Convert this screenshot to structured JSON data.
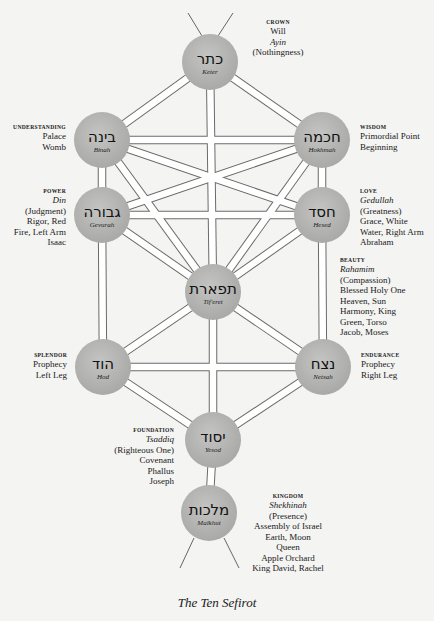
{
  "caption": "The Ten Sefirot",
  "colors": {
    "background": "#f4f4f2",
    "sefirah_fill": "#b6b6b4",
    "channel_stroke": "#6a6a6a",
    "channel_fill": "#ffffff"
  },
  "sefirot": [
    {
      "id": "keter",
      "hebrew": "כתר",
      "name": "Keter",
      "cx": 210,
      "cy": 62,
      "label": {
        "category": "CROWN",
        "lines": [
          "Will"
        ],
        "italic": "Ayin",
        "after": [
          "(Nothingness)"
        ]
      }
    },
    {
      "id": "hokhmah",
      "hebrew": "חכמה",
      "name": "Hokhmah",
      "cx": 322,
      "cy": 140,
      "label": {
        "category": "WISDOM",
        "lines": [
          "Primordial Point",
          "Beginning"
        ]
      }
    },
    {
      "id": "binah",
      "hebrew": "בינה",
      "name": "Binah",
      "cx": 102,
      "cy": 140,
      "label": {
        "category": "UNDERSTANDING",
        "lines": [
          "Palace",
          "Womb"
        ]
      }
    },
    {
      "id": "hesed",
      "hebrew": "חסד",
      "name": "Hesed",
      "cx": 322,
      "cy": 215,
      "label": {
        "category": "LOVE",
        "italic": "Gedullah",
        "after": [
          "(Greatness)",
          "Grace, White",
          "Water, Right Arm",
          "Abraham"
        ]
      }
    },
    {
      "id": "gevurah",
      "hebrew": "גבורה",
      "name": "Gevurah",
      "cx": 102,
      "cy": 215,
      "label": {
        "category": "POWER",
        "italic": "Din",
        "after": [
          "(Judgment)",
          "Rigor, Red",
          "Fire, Left Arm",
          "Isaac"
        ]
      }
    },
    {
      "id": "tiferet",
      "hebrew": "תפארת",
      "name": "Tif'eret",
      "cx": 213,
      "cy": 292,
      "label": {
        "category": "BEAUTY",
        "italic": "Rahamim",
        "after": [
          "(Compassion)",
          "Blessed Holy One",
          "Heaven, Sun",
          "Harmony, King",
          "Green, Torso",
          "Jacob, Moses"
        ]
      }
    },
    {
      "id": "netsah",
      "hebrew": "נצח",
      "name": "Netsah",
      "cx": 323,
      "cy": 367,
      "label": {
        "category": "ENDURANCE",
        "lines": [
          "Prophecy",
          "Right Leg"
        ]
      }
    },
    {
      "id": "hod",
      "hebrew": "הוד",
      "name": "Hod",
      "cx": 103,
      "cy": 367,
      "label": {
        "category": "SPLENDOR",
        "lines": [
          "Prophecy",
          "Left Leg"
        ]
      }
    },
    {
      "id": "yesod",
      "hebrew": "יסוד",
      "name": "Yesod",
      "cx": 213,
      "cy": 440,
      "label": {
        "category": "FOUNDATION",
        "italic": "Tsaddiq",
        "after": [
          "(Righteous One)",
          "Covenant",
          "Phallus",
          "Joseph"
        ]
      }
    },
    {
      "id": "malkhut",
      "hebrew": "מלכות",
      "name": "Malkhut",
      "cx": 209,
      "cy": 513,
      "label": {
        "category": "KINGDOM",
        "italic": "Shekhinah",
        "after": [
          "(Presence)",
          "Assembly of Israel",
          "Earth, Moon",
          "Queen",
          "Apple Orchard",
          "King David, Rachel"
        ]
      }
    }
  ],
  "channels": [
    [
      "keter",
      "binah"
    ],
    [
      "keter",
      "hokhmah"
    ],
    [
      "keter",
      "tiferet"
    ],
    [
      "binah",
      "hokhmah"
    ],
    [
      "binah",
      "gevurah"
    ],
    [
      "binah",
      "tiferet"
    ],
    [
      "binah",
      "hesed"
    ],
    [
      "hokhmah",
      "hesed"
    ],
    [
      "hokhmah",
      "tiferet"
    ],
    [
      "hokhmah",
      "gevurah"
    ],
    [
      "gevurah",
      "hesed"
    ],
    [
      "gevurah",
      "tiferet"
    ],
    [
      "hesed",
      "tiferet"
    ],
    [
      "gevurah",
      "hod"
    ],
    [
      "hesed",
      "netsah"
    ],
    [
      "tiferet",
      "hod"
    ],
    [
      "tiferet",
      "netsah"
    ],
    [
      "tiferet",
      "yesod"
    ],
    [
      "hod",
      "netsah"
    ],
    [
      "hod",
      "yesod"
    ],
    [
      "netsah",
      "yesod"
    ],
    [
      "yesod",
      "malkhut"
    ]
  ]
}
